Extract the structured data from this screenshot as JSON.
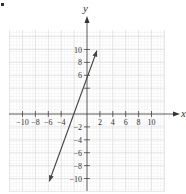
{
  "chart_data": {
    "type": "line",
    "title": "",
    "xlabel": "x",
    "ylabel": "y",
    "xlim": [
      -12,
      12
    ],
    "ylim": [
      -12,
      12
    ],
    "grid": true,
    "x_ticks": [
      -10,
      -8,
      -6,
      -4,
      2,
      4,
      6,
      8,
      10
    ],
    "y_ticks": [
      10,
      8,
      6,
      4,
      -2,
      -4,
      -6,
      -8,
      -10
    ],
    "x_tick_labels": [
      "−10",
      "−8",
      "−6",
      "−4",
      "2",
      "4",
      "6",
      "8",
      "10"
    ],
    "y_tick_labels": [
      "10",
      "8",
      "6",
      "",
      "−2",
      "−4",
      "−6",
      "−8",
      "−10"
    ],
    "series": [
      {
        "name": "line",
        "equation": "y = 3x + 6",
        "slope": 3,
        "y_intercept": 6,
        "x_intercept": -2,
        "x": [
          -6,
          2
        ],
        "y": [
          -12,
          12
        ],
        "arrows": "both",
        "color": "#444444"
      }
    ]
  }
}
